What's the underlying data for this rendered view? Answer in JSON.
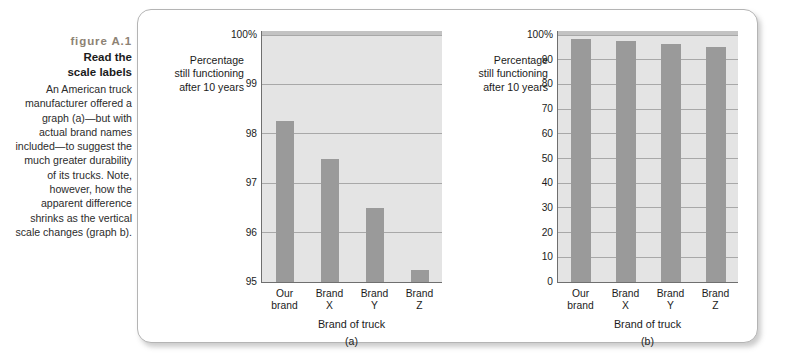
{
  "figure": {
    "number": "figure A.1",
    "title": "Read the\nscale labels",
    "description": "An American truck manufacturer offered a graph (a)—but with actual brand names included—to suggest the much greater durability of its trucks. Note, however, how the apparent difference shrinks as the vertical scale changes (graph b)."
  },
  "colors": {
    "bar": "#9a9a9a",
    "plot_background": "#e4e4e4",
    "gridline": "#a8a8a8",
    "axis": "#6f6f6f",
    "panel_border": "#b4b4b4",
    "figure_number_text": "#8d8274"
  },
  "chart_data": [
    {
      "type": "bar",
      "id": "a",
      "panel_label": "(a)",
      "title": "",
      "ylabel": "Percentage\nstill functioning\nafter 10 years",
      "xlabel": "Brand of truck",
      "categories": [
        "Our\nbrand",
        "Brand\nX",
        "Brand\nY",
        "Brand\nZ"
      ],
      "values": [
        98.25,
        97.5,
        96.5,
        95.25
      ],
      "ylim": [
        95,
        100
      ],
      "yticks": [
        95,
        96,
        97,
        98,
        99,
        100
      ],
      "ytick_labels": [
        "95",
        "96",
        "97",
        "98",
        "99",
        "100%"
      ],
      "grid": true,
      "legend": "none"
    },
    {
      "type": "bar",
      "id": "b",
      "panel_label": "(b)",
      "title": "",
      "ylabel": "Percentage\nstill functioning\nafter 10 years",
      "xlabel": "Brand of truck",
      "categories": [
        "Our\nbrand",
        "Brand\nX",
        "Brand\nY",
        "Brand\nZ"
      ],
      "values": [
        98.25,
        97.5,
        96.5,
        95.25
      ],
      "ylim": [
        0,
        100
      ],
      "yticks": [
        0,
        10,
        20,
        30,
        40,
        50,
        60,
        70,
        80,
        90,
        100
      ],
      "ytick_labels": [
        "0",
        "10",
        "20",
        "30",
        "40",
        "50",
        "60",
        "70",
        "80",
        "90",
        "100%"
      ],
      "grid": true,
      "legend": "none"
    }
  ]
}
